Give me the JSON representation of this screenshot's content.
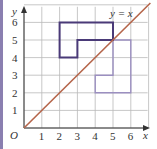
{
  "diagram": {
    "title": "",
    "axes": {
      "x_label": "x",
      "y_label": "y",
      "origin_label": "O",
      "x_ticks": [
        "1",
        "2",
        "3",
        "4",
        "5",
        "6"
      ],
      "y_ticks": [
        "1",
        "2",
        "3",
        "4",
        "5",
        "6"
      ],
      "range": [
        0,
        7
      ]
    },
    "line": {
      "label": "y = x",
      "equation": "y = x",
      "color": "#b5654a"
    },
    "shapes": {
      "original": {
        "name": "L-shape",
        "vertices": [
          [
            2,
            4
          ],
          [
            2,
            6
          ],
          [
            5,
            6
          ],
          [
            5,
            5
          ],
          [
            3,
            5
          ],
          [
            3,
            4
          ]
        ],
        "color": "#4a3a78"
      },
      "image": {
        "name": "reflected L-shape",
        "vertices": [
          [
            4,
            2
          ],
          [
            6,
            2
          ],
          [
            6,
            5
          ],
          [
            5,
            5
          ],
          [
            5,
            3
          ],
          [
            4,
            3
          ]
        ],
        "color": "#9b8fc0"
      }
    },
    "grid_color": "#b9b9b9",
    "accent_bar_color": "#8a7fb0"
  }
}
